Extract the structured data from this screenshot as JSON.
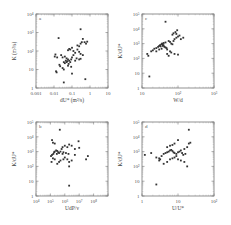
{
  "chart_data": [
    {
      "type": "scatter",
      "panel_label": "a",
      "xlabel": "dU* (m²/s)",
      "ylabel": "K (m²/s)",
      "xscale": "log",
      "yscale": "log",
      "xlim": [
        0.001,
        10
      ],
      "ylim": [
        1,
        10000
      ],
      "xticks": [
        "0.001",
        "0.01",
        "0.1",
        "1",
        "10"
      ],
      "yticks": [
        "1",
        "10",
        "10²",
        "10³",
        "10⁴"
      ],
      "grid": false,
      "estimated": true,
      "points": [
        [
          0.018,
          500
        ],
        [
          0.3,
          1500
        ],
        [
          0.55,
          3
        ],
        [
          0.035,
          2
        ],
        [
          0.012,
          65
        ],
        [
          0.015,
          45
        ],
        [
          0.011,
          50
        ],
        [
          0.025,
          60
        ],
        [
          0.03,
          45
        ],
        [
          0.04,
          50
        ],
        [
          0.05,
          40
        ],
        [
          0.06,
          35
        ],
        [
          0.045,
          30
        ],
        [
          0.05,
          25
        ],
        [
          0.055,
          28
        ],
        [
          0.04,
          22
        ],
        [
          0.035,
          25
        ],
        [
          0.065,
          20
        ],
        [
          0.07,
          30
        ],
        [
          0.08,
          25
        ],
        [
          0.09,
          35
        ],
        [
          0.1,
          45
        ],
        [
          0.12,
          60
        ],
        [
          0.15,
          80
        ],
        [
          0.06,
          110
        ],
        [
          0.07,
          130
        ],
        [
          0.08,
          120
        ],
        [
          0.1,
          150
        ],
        [
          0.12,
          100
        ],
        [
          0.2,
          200
        ],
        [
          0.25,
          180
        ],
        [
          0.3,
          250
        ],
        [
          0.35,
          300
        ],
        [
          0.4,
          450
        ],
        [
          0.5,
          300
        ],
        [
          0.6,
          250
        ],
        [
          0.7,
          320
        ],
        [
          0.2,
          120
        ],
        [
          0.25,
          90
        ],
        [
          0.3,
          70
        ],
        [
          0.4,
          60
        ],
        [
          0.18,
          40
        ],
        [
          0.15,
          30
        ],
        [
          0.02,
          18
        ],
        [
          0.022,
          15
        ],
        [
          0.03,
          12
        ],
        [
          0.035,
          10
        ],
        [
          0.013,
          8
        ],
        [
          0.014,
          7
        ],
        [
          0.06,
          16
        ],
        [
          0.09,
          14
        ],
        [
          0.1,
          6
        ],
        [
          0.25,
          35
        ],
        [
          0.3,
          38
        ]
      ]
    },
    {
      "type": "scatter",
      "panel_label": "c",
      "xlabel": "W/d",
      "ylabel": "K/dU*",
      "xscale": "log",
      "yscale": "log",
      "xlim": [
        10,
        1000
      ],
      "ylim": [
        1,
        100000
      ],
      "xticks": [
        "10",
        "10²",
        "10³"
      ],
      "yticks": [
        "1",
        "10",
        "10²",
        "10³",
        "10⁴",
        "10⁵"
      ],
      "grid": false,
      "estimated": true,
      "points": [
        [
          45,
          30000
        ],
        [
          16,
          6
        ],
        [
          14,
          200
        ],
        [
          15,
          150
        ],
        [
          18,
          300
        ],
        [
          20,
          350
        ],
        [
          22,
          450
        ],
        [
          25,
          500
        ],
        [
          28,
          600
        ],
        [
          30,
          700
        ],
        [
          32,
          800
        ],
        [
          35,
          900
        ],
        [
          33,
          650
        ],
        [
          38,
          700
        ],
        [
          40,
          750
        ],
        [
          42,
          600
        ],
        [
          45,
          550
        ],
        [
          48,
          500
        ],
        [
          50,
          400
        ],
        [
          38,
          900
        ],
        [
          36,
          1000
        ],
        [
          40,
          1100
        ],
        [
          45,
          1200
        ],
        [
          55,
          1500
        ],
        [
          60,
          1300
        ],
        [
          65,
          1000
        ],
        [
          70,
          900
        ],
        [
          75,
          1500
        ],
        [
          80,
          2000
        ],
        [
          90,
          2500
        ],
        [
          100,
          3000
        ],
        [
          110,
          3500
        ],
        [
          70,
          4000
        ],
        [
          75,
          5000
        ],
        [
          85,
          6000
        ],
        [
          90,
          4500
        ],
        [
          95,
          8000
        ],
        [
          120,
          2000
        ],
        [
          140,
          2500
        ],
        [
          60,
          300
        ],
        [
          65,
          250
        ],
        [
          50,
          200
        ],
        [
          55,
          150
        ],
        [
          80,
          200
        ],
        [
          100,
          180
        ],
        [
          35,
          450
        ],
        [
          30,
          400
        ],
        [
          25,
          300
        ]
      ]
    },
    {
      "type": "scatter",
      "panel_label": "b",
      "xlabel": "UdP/ν",
      "ylabel": "K/dU*",
      "xscale": "log",
      "yscale": "log",
      "xlim": [
        10000,
        1000000000
      ],
      "ylim": [
        1,
        100000
      ],
      "xticks": [
        "10⁴",
        "10⁵",
        "10⁶",
        "10⁷",
        "10⁸"
      ],
      "yticks": [
        "1",
        "10",
        "10²",
        "10³",
        "10⁴",
        "10⁵"
      ],
      "grid": false,
      "estimated": true,
      "points": [
        [
          450000,
          30000
        ],
        [
          2000000,
          5
        ],
        [
          130000,
          6000
        ],
        [
          150000,
          4000
        ],
        [
          200000,
          3500
        ],
        [
          120000,
          200
        ],
        [
          110000,
          500
        ],
        [
          130000,
          600
        ],
        [
          160000,
          700
        ],
        [
          180000,
          900
        ],
        [
          200000,
          1000
        ],
        [
          250000,
          1200
        ],
        [
          300000,
          1100
        ],
        [
          350000,
          900
        ],
        [
          280000,
          700
        ],
        [
          400000,
          800
        ],
        [
          500000,
          1000
        ],
        [
          600000,
          1500
        ],
        [
          700000,
          2000
        ],
        [
          1000000,
          2500
        ],
        [
          1500000,
          2000
        ],
        [
          2000000,
          3000
        ],
        [
          3000000,
          2500
        ],
        [
          5000000,
          1500
        ],
        [
          10000000,
          1800
        ],
        [
          9000000,
          5000
        ],
        [
          30000000,
          300
        ],
        [
          40000000,
          500
        ],
        [
          1000000,
          400
        ],
        [
          800000,
          300
        ],
        [
          1500000,
          300
        ],
        [
          2000000,
          200
        ],
        [
          3000000,
          250
        ],
        [
          5000000,
          600
        ],
        [
          2000000,
          100
        ],
        [
          500000,
          250
        ],
        [
          400000,
          200
        ],
        [
          300000,
          150
        ],
        [
          200000,
          300
        ],
        [
          150000,
          350
        ],
        [
          700000,
          700
        ],
        [
          800000,
          900
        ],
        [
          1200000,
          800
        ],
        [
          1800000,
          700
        ]
      ]
    },
    {
      "type": "scatter",
      "panel_label": "d",
      "xlabel": "U/U*",
      "ylabel": "K/dU*",
      "xscale": "log",
      "yscale": "log",
      "xlim": [
        1,
        100
      ],
      "ylim": [
        1,
        100000
      ],
      "xticks": [
        "1",
        "10",
        "10²"
      ],
      "yticks": [
        "1",
        "10",
        "10²",
        "10³",
        "10⁴",
        "10⁵"
      ],
      "grid": false,
      "estimated": true,
      "points": [
        [
          20,
          30000
        ],
        [
          2.5,
          6
        ],
        [
          1.2,
          600
        ],
        [
          1.8,
          800
        ],
        [
          2.5,
          400
        ],
        [
          3,
          350
        ],
        [
          3.5,
          500
        ],
        [
          4,
          700
        ],
        [
          4.5,
          800
        ],
        [
          5,
          900
        ],
        [
          5.5,
          1000
        ],
        [
          6,
          1200
        ],
        [
          6.5,
          1300
        ],
        [
          7,
          1100
        ],
        [
          7.5,
          900
        ],
        [
          8,
          800
        ],
        [
          9,
          700
        ],
        [
          10,
          900
        ],
        [
          11,
          1000
        ],
        [
          12,
          1200
        ],
        [
          13,
          800
        ],
        [
          15,
          1500
        ],
        [
          18,
          2000
        ],
        [
          20,
          3500
        ],
        [
          22,
          4000
        ],
        [
          5,
          2000
        ],
        [
          6,
          2500
        ],
        [
          7,
          2800
        ],
        [
          4,
          150
        ],
        [
          5,
          200
        ],
        [
          6,
          300
        ],
        [
          7,
          350
        ],
        [
          8,
          400
        ],
        [
          9,
          500
        ],
        [
          3,
          250
        ],
        [
          3.2,
          300
        ],
        [
          10,
          300
        ],
        [
          12,
          250
        ],
        [
          15,
          200
        ],
        [
          18,
          100
        ],
        [
          14,
          600
        ],
        [
          16,
          700
        ],
        [
          8,
          3500
        ],
        [
          10,
          6000
        ]
      ]
    }
  ],
  "figure": {
    "panels": [
      {
        "label": "a",
        "xlabel": "dU* (m²/s)",
        "ylabel": "K (m²/s)"
      },
      {
        "label": "c",
        "xlabel": "W/d",
        "ylabel": "K/dU*"
      },
      {
        "label": "b",
        "xlabel": "UdP/ν",
        "ylabel": "K/dU*"
      },
      {
        "label": "d",
        "xlabel": "U/U*",
        "ylabel": "K/dU*"
      }
    ]
  }
}
